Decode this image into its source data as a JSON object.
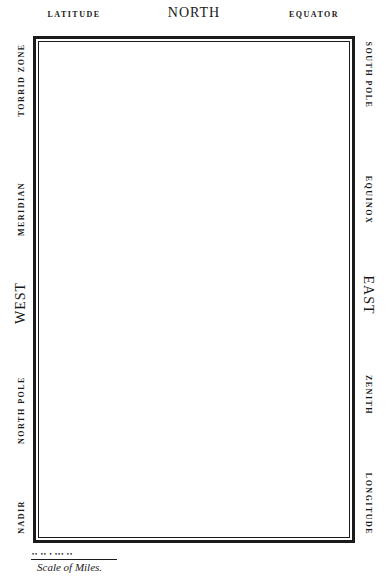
{
  "map_frame": {
    "top": {
      "left_label": "LATITUDE",
      "center_label": "NORTH",
      "right_label": "EQUATOR"
    },
    "left_side": {
      "labels": [
        "TORRID ZONE",
        "MERIDIAN",
        "WEST",
        "NORTH POLE",
        "NADIR"
      ]
    },
    "right_side": {
      "labels": [
        "SOUTH POLE",
        "EQUINOX",
        "EAST",
        "ZENITH",
        "LONGITUDE"
      ]
    },
    "border_color": "#1a1a1a",
    "background_color": "#ffffff"
  },
  "scale": {
    "ticks": "•• •• • ••• ••",
    "caption": "Scale of Miles."
  }
}
